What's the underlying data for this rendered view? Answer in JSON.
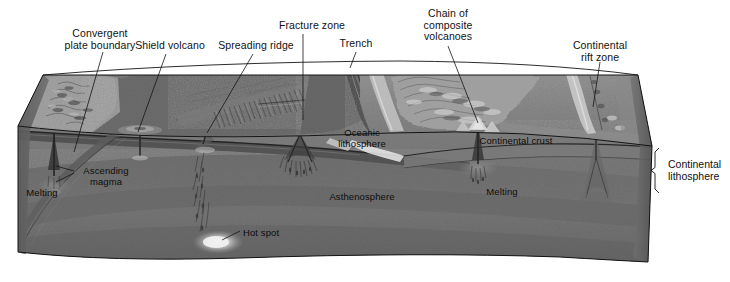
{
  "figure": {
    "kind": "geology-block-diagram",
    "background_color": "#ffffff"
  },
  "callouts": [
    {
      "id": "convergent-plate-boundary",
      "text": "Convergent\nplate boundary",
      "x": 52,
      "y": 28,
      "width": 96,
      "align": "center"
    },
    {
      "id": "shield-volcano",
      "text": "Shield volcano",
      "x": 128,
      "y": 40,
      "width": 84,
      "align": "center"
    },
    {
      "id": "spreading-ridge",
      "text": "Spreading ridge",
      "x": 212,
      "y": 40,
      "width": 88,
      "align": "center"
    },
    {
      "id": "fracture-zone",
      "text": "Fracture zone",
      "x": 272,
      "y": 20,
      "width": 80,
      "align": "center"
    },
    {
      "id": "trench",
      "text": "Trench",
      "x": 333,
      "y": 38,
      "width": 46,
      "align": "center"
    },
    {
      "id": "chain-of-composite-volcanoes",
      "text": "Chain of\ncomposite\nvolcanoes",
      "x": 414,
      "y": 8,
      "width": 68,
      "align": "center"
    },
    {
      "id": "continental-rift-zone",
      "text": "Continental\nrift zone",
      "x": 566,
      "y": 40,
      "width": 68,
      "align": "center"
    }
  ],
  "interior_labels": [
    {
      "id": "oceanic-lithosphere",
      "text": "Oceanic\nlithosphere",
      "x": 330,
      "y": 128,
      "width": 64,
      "align": "center"
    },
    {
      "id": "continental-crust",
      "text": "Continental crust",
      "x": 472,
      "y": 136,
      "width": 88,
      "align": "center"
    },
    {
      "id": "asthenosphere",
      "text": "Asthenosphere",
      "x": 323,
      "y": 192,
      "width": 78,
      "align": "center"
    },
    {
      "id": "ascending-magma",
      "text": "Ascending\nmagma",
      "x": 77,
      "y": 166,
      "width": 58,
      "align": "center"
    },
    {
      "id": "melting-left",
      "text": "Melting",
      "x": 22,
      "y": 188,
      "width": 40,
      "align": "center"
    },
    {
      "id": "melting-right",
      "text": "Melting",
      "x": 482,
      "y": 187,
      "width": 40,
      "align": "center"
    },
    {
      "id": "hot-spot",
      "text": "Hot spot",
      "x": 243,
      "y": 228,
      "width": 48,
      "align": "left"
    }
  ],
  "bracket": {
    "id": "continental-lithosphere",
    "label": "Continental\nlithosphere",
    "label_x": 668,
    "label_y": 158,
    "x": 655,
    "y_top": 148,
    "y_bottom": 193
  },
  "leader_lines": [
    {
      "from": "convergent-plate-boundary",
      "x1": 103,
      "y1": 52,
      "x2": 74,
      "y2": 152
    },
    {
      "from": "shield-volcano",
      "x1": 166,
      "y1": 54,
      "x2": 138,
      "y2": 132
    },
    {
      "from": "spreading-ridge",
      "x1": 253,
      "y1": 54,
      "x2": 207,
      "y2": 133
    },
    {
      "from": "fracture-zone",
      "x1": 303,
      "y1": 34,
      "x2": 303,
      "y2": 120
    },
    {
      "from": "trench",
      "x1": 356,
      "y1": 52,
      "x2": 350,
      "y2": 68
    },
    {
      "from": "chain-of-composite-volcanoes",
      "x1": 448,
      "y1": 46,
      "x2": 478,
      "y2": 123
    },
    {
      "from": "continental-rift-zone",
      "x1": 600,
      "y1": 62,
      "x2": 593,
      "y2": 107
    },
    {
      "from": "hot-spot",
      "x1": 240,
      "y1": 231,
      "x2": 222,
      "y2": 240
    },
    {
      "from": "ascending-magma",
      "x1": 74,
      "y1": 171,
      "x2": 56,
      "y2": 166
    },
    {
      "from": "ascending-magma-2",
      "x1": 74,
      "y1": 173,
      "x2": 56,
      "y2": 182
    }
  ],
  "palette": {
    "ocean_floor": "#6e6e6e",
    "ocean_floor_dark": "#5a5a5a",
    "continent_surface": "#8b8b8b",
    "continent_highland": "#a8a8a8",
    "lithosphere_band": "#4a4a4a",
    "asthenosphere": "#727272",
    "asthenosphere_deep": "#656565",
    "front_face": "#787878",
    "outline": "#1a1a1a",
    "hot_spot_glow": "#f2f2f2",
    "text": "#111111"
  }
}
